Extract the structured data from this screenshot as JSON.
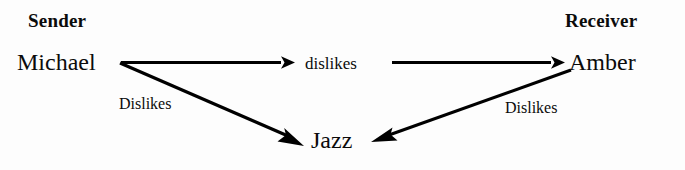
{
  "diagram": {
    "type": "directed-graph",
    "background_color": "#fdfdfd",
    "stroke_color": "#000000",
    "headings": {
      "sender": "Sender",
      "receiver": "Receiver"
    },
    "nodes": [
      {
        "id": "michael",
        "label": "Michael",
        "role": "sender"
      },
      {
        "id": "dislikes",
        "label": "dislikes",
        "role": "relation"
      },
      {
        "id": "amber",
        "label": "Amber",
        "role": "receiver"
      },
      {
        "id": "jazz",
        "label": "Jazz",
        "role": "object"
      }
    ],
    "edges": [
      {
        "id": "michael-to-dislikes",
        "from": "michael",
        "to": "dislikes",
        "label": "",
        "style": "horizontal-arrow"
      },
      {
        "id": "dislikes-to-amber",
        "from": "dislikes",
        "to": "amber",
        "label": "",
        "style": "horizontal-arrow"
      },
      {
        "id": "michael-to-jazz",
        "from": "michael",
        "to": "jazz",
        "label": "Dislikes",
        "style": "diagonal-arrow"
      },
      {
        "id": "amber-to-jazz",
        "from": "amber",
        "to": "jazz",
        "label": "Dislikes",
        "style": "diagonal-arrow"
      }
    ]
  }
}
